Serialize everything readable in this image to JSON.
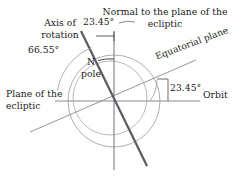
{
  "figure": {
    "background_color": "#ffffff",
    "labels": {
      "normal_to_ecliptic": "Normal to the plane of the ecliptic",
      "axis_of_rotation": "Axis of rotation",
      "north_pole": "N pole",
      "equatorial_plane": "Equatorial plane",
      "plane_of_ecliptic": "Plane of the ecliptic",
      "orbit": "Orbit",
      "angle_axis_to_normal": "23.45°",
      "angle_axis_to_ecliptic": "66.55°",
      "angle_equator_to_orbit": "23.45°"
    },
    "colors": {
      "axis_line": "#5a5a60",
      "thin_line": "#8a8a90",
      "circle": "#9a9aa0",
      "text": "#1a1a1a"
    },
    "geometry": {
      "center_x": 114,
      "center_y": 101,
      "outer_radius": 46,
      "inner_radius": 37,
      "tilt_degrees": 23.45,
      "complement_degrees": 66.55
    }
  }
}
